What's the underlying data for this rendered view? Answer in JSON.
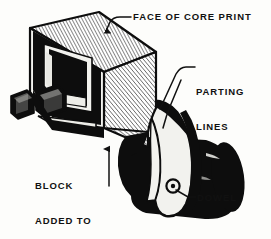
{
  "figure": {
    "background_color": "#fdfdfb",
    "ink_color": "#111111",
    "hatch_color": "#1a1a1a",
    "solid_fill": "#0d0d0d",
    "light_fill": "#f2f2ee"
  },
  "labels": {
    "face_of_core_print": "FACE OF CORE PRINT",
    "parting_lines_1": "PARTING",
    "parting_lines_2": "LINES",
    "block_1": "BLOCK",
    "block_2": "ADDED TO",
    "block_3": "PATTERN—",
    "dowel": "DOWEL"
  },
  "leaders": [
    {
      "name": "leader-face-of-core-print",
      "from": "label",
      "to": "top-face-of-block",
      "arrow": true
    },
    {
      "name": "leader-parting-lines-upper",
      "from": "label",
      "to": "upper-parting-line",
      "arrow": false
    },
    {
      "name": "leader-parting-lines-lower",
      "from": "label",
      "to": "lower-parting-line",
      "arrow": false
    },
    {
      "name": "leader-block-added-to-pattern",
      "from": "label",
      "to": "block-corner",
      "arrow": true
    },
    {
      "name": "leader-dowel",
      "from": "label",
      "to": "dowel-circle",
      "arrow": false
    }
  ],
  "parts": [
    {
      "name": "core-print-block",
      "fill": "hatched"
    },
    {
      "name": "cavity-recess",
      "fill": "solid-black"
    },
    {
      "name": "left-tab-outer",
      "fill": "solid-black"
    },
    {
      "name": "left-tab-inner",
      "fill": "solid-black"
    },
    {
      "name": "curved-flange",
      "fill": "light"
    },
    {
      "name": "cylinder-body",
      "fill": "solid-black"
    },
    {
      "name": "dowel-circle",
      "fill": "light"
    }
  ]
}
